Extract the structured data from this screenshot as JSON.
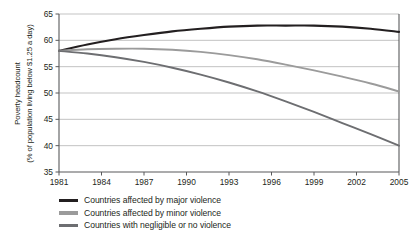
{
  "chart_data": {
    "type": "line",
    "title": "",
    "subtitle": "",
    "xlabel": "",
    "ylabel": "Poverty headcount (% of population living below $1.25 a day)",
    "ylabel_line1": "Poverty headcount",
    "ylabel_line2": "(% of population living below $1.25 a day)",
    "xlim": [
      1981,
      2005
    ],
    "ylim": [
      35,
      65
    ],
    "xticks": [
      1981,
      1984,
      1987,
      1990,
      1993,
      1996,
      1999,
      2002,
      2005
    ],
    "yticks": [
      35,
      40,
      45,
      50,
      55,
      60,
      65
    ],
    "grid": "horizontal",
    "legend_position": "below-left",
    "x": [
      1981,
      1983,
      1985,
      1987,
      1989,
      1991,
      1993,
      1995,
      1997,
      1999,
      2001,
      2003,
      2005
    ],
    "series": [
      {
        "name": "Countries affected by major violence",
        "color": "#231f20",
        "width": 2.1,
        "values": [
          58.0,
          59.2,
          60.2,
          61.0,
          61.7,
          62.2,
          62.6,
          62.8,
          62.8,
          62.8,
          62.6,
          62.2,
          61.6
        ]
      },
      {
        "name": "Countries affected by minor violence",
        "color": "#9b9b9b",
        "width": 1.9,
        "values": [
          58.0,
          58.3,
          58.4,
          58.4,
          58.2,
          57.8,
          57.2,
          56.4,
          55.4,
          54.3,
          53.1,
          51.8,
          50.3
        ]
      },
      {
        "name": "Countries with negligible or no violence",
        "color": "#6d6e71",
        "width": 1.9,
        "values": [
          58.0,
          57.5,
          56.8,
          55.9,
          54.8,
          53.5,
          52.0,
          50.3,
          48.4,
          46.4,
          44.3,
          42.2,
          40.0
        ]
      }
    ]
  },
  "axes": {
    "y_tick_labels": [
      "65",
      "60",
      "55",
      "50",
      "45",
      "40",
      "35"
    ],
    "x_tick_labels": [
      "1981",
      "1984",
      "1987",
      "1990",
      "1993",
      "1996",
      "1999",
      "2002",
      "2005"
    ]
  },
  "legend": {
    "items": [
      {
        "label": "Countries affected by major violence",
        "color": "#231f20"
      },
      {
        "label": "Countries affected by minor violence",
        "color": "#9b9b9b"
      },
      {
        "label": "Countries with negligible or no violence",
        "color": "#6d6e71"
      }
    ]
  },
  "colors": {
    "background": "#ffffff",
    "text": "#231f20",
    "gridline": "#9a9a9a",
    "axis": "#58595b"
  }
}
